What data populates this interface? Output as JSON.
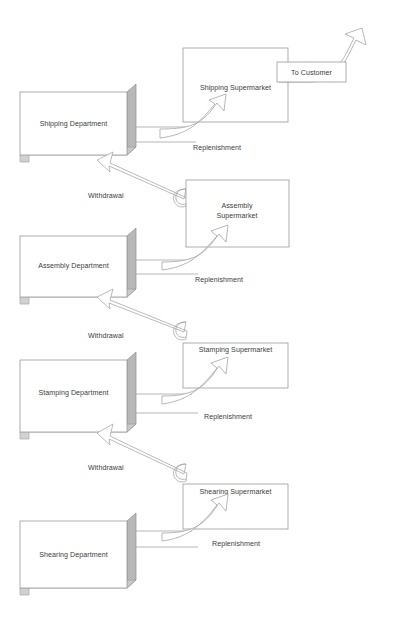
{
  "diagram": {
    "type": "process-flow",
    "colors": {
      "box_fill": "#ffffff",
      "box_stroke": "#9a9a9a",
      "box_side_shade": "#b8b8b8",
      "box_bottom_shade": "#c9c9c9",
      "arrow_fill": "#ffffff",
      "arrow_stroke": "#a5a5a5",
      "text": "#3d3d3d"
    },
    "departments": [
      {
        "id": "shipping",
        "label": "Shipping Department"
      },
      {
        "id": "assembly",
        "label": "Assembly Department"
      },
      {
        "id": "stamping",
        "label": "Stamping Department"
      },
      {
        "id": "shearing",
        "label": "Shearing Department"
      }
    ],
    "supermarkets": [
      {
        "id": "shipping-sm",
        "label": "Shipping Supermarket",
        "line1": "Shipping Supermarket",
        "line2": ""
      },
      {
        "id": "assembly-sm",
        "label": "Assembly Supermarket",
        "line1": "Assembly",
        "line2": "Supermarket"
      },
      {
        "id": "stamping-sm",
        "label": "Stamping Supermarket",
        "line1": "Stamping Supermarket",
        "line2": ""
      },
      {
        "id": "shearing-sm",
        "label": "Shearing Supermarket",
        "line1": "Shearing Supermarket",
        "line2": ""
      }
    ],
    "flows": {
      "replenishment": "Replenishment",
      "withdrawal": "Withdrawal",
      "to_customer": "To Customer"
    },
    "replenishment_labels": [
      "Replenishment",
      "Replenishment",
      "Replenishment",
      "Replenishment"
    ],
    "withdrawal_labels": [
      "Withdrawal",
      "Withdrawal",
      "Withdrawal"
    ],
    "customer_label": "To Customer"
  }
}
